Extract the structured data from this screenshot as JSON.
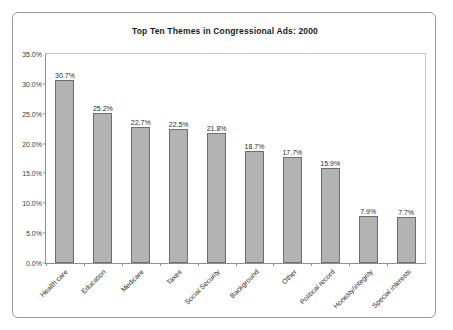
{
  "chart_data": {
    "type": "bar",
    "title": "Top Ten Themes in Congressional Ads: 2000",
    "xlabel": "",
    "ylabel": "",
    "ylim": [
      0,
      35
    ],
    "grid": false,
    "legend": "none",
    "categories": [
      "Health care",
      "Education",
      "Medicare",
      "Taxes",
      "Social Security",
      "Background",
      "Other",
      "Political record",
      "Honesty/integrity",
      "Special interests"
    ],
    "values": [
      30.7,
      25.2,
      22.7,
      22.5,
      21.8,
      18.7,
      17.7,
      15.9,
      7.9,
      7.7
    ],
    "value_labels": [
      "30.7%",
      "25.2%",
      "22.7%",
      "22.5%",
      "21.8%",
      "18.7%",
      "17.7%",
      "15.9%",
      "7.9%",
      "7.7%"
    ],
    "y_ticks": [
      35.0,
      30.0,
      25.0,
      20.0,
      15.0,
      10.0,
      5.0,
      0.0
    ],
    "y_tick_labels": [
      "35.0%",
      "30.0%",
      "25.0%",
      "20.0%",
      "15.0%",
      "10.0%",
      "5.0%",
      "0.0%"
    ],
    "colors": {
      "bar_fill": "#b3b3b3",
      "bar_border": "#6e6e6e",
      "axis": "#8f8f8f",
      "text": "#2a2a2a",
      "card_border": "#9a9a9a",
      "background": "#ffffff"
    }
  }
}
